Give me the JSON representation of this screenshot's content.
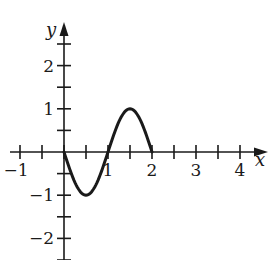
{
  "chart_data": {
    "type": "line",
    "title": "",
    "xlabel": "x",
    "ylabel": "y",
    "xlim": [
      -1.1,
      4.5
    ],
    "ylim": [
      -2.5,
      2.6
    ],
    "grid": false,
    "x_ticks": [
      -1,
      -0.5,
      0,
      0.5,
      1,
      1.5,
      2,
      2.5,
      3,
      3.5,
      4
    ],
    "x_tick_labels": [
      {
        "value": -1,
        "label": "−1"
      },
      {
        "value": 1,
        "label": "1"
      },
      {
        "value": 2,
        "label": "2"
      },
      {
        "value": 3,
        "label": "3"
      },
      {
        "value": 4,
        "label": "4"
      }
    ],
    "y_ticks": [
      -2.5,
      -2,
      -1.5,
      -1,
      -0.5,
      0.5,
      1,
      1.5,
      2,
      2.5
    ],
    "y_tick_labels": [
      {
        "value": 2,
        "label": "2"
      },
      {
        "value": 1,
        "label": "1"
      },
      {
        "value": -1,
        "label": "−1"
      },
      {
        "value": -2,
        "label": "−2"
      }
    ],
    "series": [
      {
        "name": "y = -sin(πx), 0 ≤ x ≤ 2",
        "x": [
          0,
          0.25,
          0.5,
          0.75,
          1,
          1.25,
          1.5,
          1.75,
          2
        ],
        "y": [
          0,
          -0.71,
          -1,
          -0.71,
          0,
          0.71,
          1,
          0.71,
          0
        ]
      }
    ]
  },
  "labels": {
    "x_axis": "x",
    "y_axis": "y"
  },
  "colors": {
    "stroke": "#1a1a1a",
    "background": "#ffffff"
  }
}
